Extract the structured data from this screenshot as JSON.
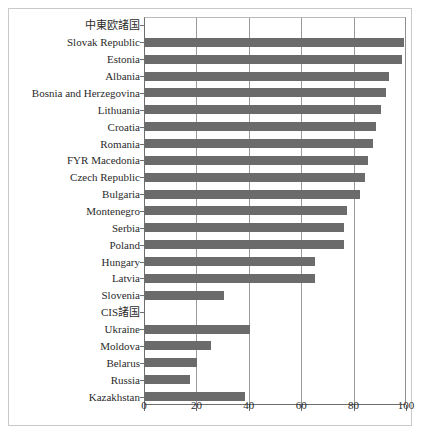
{
  "chart_data": {
    "type": "bar",
    "orientation": "horizontal",
    "title": "",
    "xlabel": "",
    "ylabel": "",
    "xlim": [
      0,
      100
    ],
    "xticks": [
      0,
      20,
      40,
      60,
      80,
      100
    ],
    "xticklabels": [
      "0",
      "20",
      "40",
      "60",
      "80",
      "100"
    ],
    "grid": true,
    "grid_axis": "x",
    "legend": null,
    "bar_color": "#6b6b6b",
    "groups": [
      {
        "label": "中東欧諸国",
        "is_header": true
      },
      {
        "label": "CIS諸国",
        "is_header": true
      }
    ],
    "categories": [
      "中東欧諸国",
      "Slovak Republic",
      "Estonia",
      "Albania",
      "Bosnia and Herzegovina",
      "Lithuania",
      "Croatia",
      "Romania",
      "FYR Macedonia",
      "Czech Republic",
      "Bulgaria",
      "Montenegro",
      "Serbia",
      "Poland",
      "Hungary",
      "Latvia",
      "Slovenia",
      "CIS諸国",
      "Ukraine",
      "Moldova",
      "Belarus",
      "Russia",
      "Kazakhstan"
    ],
    "values": [
      null,
      99,
      98,
      93,
      92,
      90,
      88,
      87,
      85,
      84,
      82,
      77,
      76,
      76,
      65,
      65,
      30,
      null,
      40,
      25,
      20,
      17,
      38
    ],
    "rows": [
      {
        "label": "中東欧諸国",
        "value": null,
        "header": true
      },
      {
        "label": "Slovak Republic",
        "value": 99,
        "header": false
      },
      {
        "label": "Estonia",
        "value": 98,
        "header": false
      },
      {
        "label": "Albania",
        "value": 93,
        "header": false
      },
      {
        "label": "Bosnia and Herzegovina",
        "value": 92,
        "header": false
      },
      {
        "label": "Lithuania",
        "value": 90,
        "header": false
      },
      {
        "label": "Croatia",
        "value": 88,
        "header": false
      },
      {
        "label": "Romania",
        "value": 87,
        "header": false
      },
      {
        "label": "FYR Macedonia",
        "value": 85,
        "header": false
      },
      {
        "label": "Czech Republic",
        "value": 84,
        "header": false
      },
      {
        "label": "Bulgaria",
        "value": 82,
        "header": false
      },
      {
        "label": "Montenegro",
        "value": 77,
        "header": false
      },
      {
        "label": "Serbia",
        "value": 76,
        "header": false
      },
      {
        "label": "Poland",
        "value": 76,
        "header": false
      },
      {
        "label": "Hungary",
        "value": 65,
        "header": false
      },
      {
        "label": "Latvia",
        "value": 65,
        "header": false
      },
      {
        "label": "Slovenia",
        "value": 30,
        "header": false
      },
      {
        "label": "CIS諸国",
        "value": null,
        "header": true
      },
      {
        "label": "Ukraine",
        "value": 40,
        "header": false
      },
      {
        "label": "Moldova",
        "value": 25,
        "header": false
      },
      {
        "label": "Belarus",
        "value": 20,
        "header": false
      },
      {
        "label": "Russia",
        "value": 17,
        "header": false
      },
      {
        "label": "Kazakhstan",
        "value": 38,
        "header": false
      }
    ]
  }
}
